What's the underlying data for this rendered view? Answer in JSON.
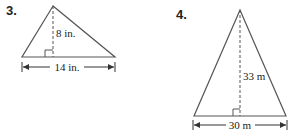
{
  "problems": [
    {
      "number": "3.",
      "shape": "triangle",
      "height_label": "8 in.",
      "base_label": "14 in.",
      "height": 8,
      "base": 14,
      "unit": "in."
    },
    {
      "number": "4.",
      "shape": "triangle",
      "height_label": "33 m",
      "base_label": "30 m",
      "height": 33,
      "base": 30,
      "unit": "m"
    }
  ],
  "colors": {
    "line": "#555555",
    "text": "#222222",
    "background": "#ffffff"
  }
}
